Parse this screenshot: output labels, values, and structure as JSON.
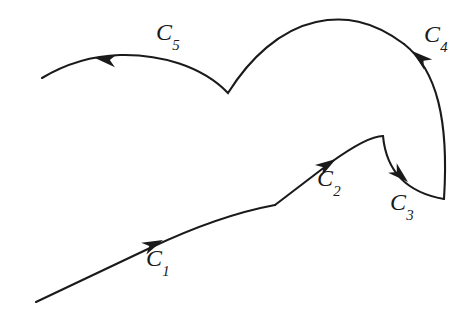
{
  "figure": {
    "background_color": "#ffffff",
    "stroke_color": "#1a1a1a",
    "stroke_width": 2.1,
    "width": 467,
    "height": 322
  },
  "labels": {
    "c1": {
      "base": "C",
      "sub": "1",
      "text": "C₁"
    },
    "c2": {
      "base": "C",
      "sub": "2",
      "text": "C₂"
    },
    "c3": {
      "base": "C",
      "sub": "3",
      "text": "C₃"
    },
    "c4": {
      "base": "C",
      "sub": "4",
      "text": "C₄"
    },
    "c5": {
      "base": "C",
      "sub": "5",
      "text": "C₅"
    }
  },
  "chart_data": {
    "type": "line",
    "xlabel": "",
    "ylabel": "",
    "xlim": [
      0,
      467
    ],
    "ylim": [
      322,
      0
    ],
    "grid": false,
    "legend": "none",
    "note": "Coordinates are in image pixel space; y increases downward.",
    "series": [
      {
        "name": "C₁",
        "label": "C₁",
        "direction": "forward",
        "start": [
          36,
          302
        ],
        "end": [
          275,
          205
        ],
        "path": "M 36 302 L 150 248 C 205 222 248 210 275 205",
        "arrow": {
          "at": [
            163,
            240
          ],
          "angle_deg": -24
        },
        "label_pos": [
          146,
          246
        ]
      },
      {
        "name": "C₂",
        "label": "C₂",
        "direction": "forward",
        "start": [
          275,
          205
        ],
        "end": [
          383,
          136
        ],
        "path": "M 275 205 L 330 163 C 355 145 372 136 383 136",
        "arrow": {
          "at": [
            336,
            159
          ],
          "angle_deg": -33
        },
        "label_pos": [
          317,
          166
        ]
      },
      {
        "name": "C₃",
        "label": "C₃",
        "direction": "forward",
        "start": [
          383,
          136
        ],
        "end": [
          444,
          199
        ],
        "path": "M 383 136 C 386 168 404 192 444 199",
        "arrow": {
          "at": [
            408,
            182
          ],
          "angle_deg": 42
        },
        "label_pos": [
          390,
          190
        ]
      },
      {
        "name": "C₄",
        "label": "C₄",
        "direction": "forward",
        "start": [
          444,
          199
        ],
        "end": [
          404,
          44
        ],
        "path": "M 444 199 C 449 120 437 70 404 44",
        "arrow": {
          "at": [
            412,
            51
          ],
          "angle_deg": -140
        },
        "label_pos": [
          424,
          22
        ]
      },
      {
        "name": "C₅",
        "label": "C₅",
        "direction": "forward",
        "start": [
          404,
          44
        ],
        "end": [
          42,
          78
        ],
        "path": "M 404 44 C 372 20 344 16 316 22 C 280 30 250 58 228 93 C 202 66 160 54 120 55 C 88 56 62 66 42 78",
        "arrow": {
          "at": [
            95,
            58
          ],
          "angle_deg": 188
        },
        "label_pos": [
          156,
          20
        ],
        "vertex": [
          228,
          93
        ]
      }
    ]
  }
}
